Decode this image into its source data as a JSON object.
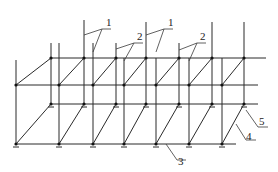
{
  "diagram": {
    "type": "scaffold-frame-isometric",
    "colors": {
      "line": "#2a2a2a",
      "node": "#111111",
      "background": "#ffffff"
    },
    "rows": {
      "back_upper_y": 58,
      "front_upper_y": 85,
      "back_lower_y": 104,
      "front_lower_y": 144
    },
    "back_x": [
      51,
      84,
      116,
      146,
      179,
      212,
      244
    ],
    "front_x": [
      16,
      59,
      93,
      124,
      156,
      189,
      222
    ],
    "labels": [
      {
        "id": "1a",
        "text": "1",
        "x": 106,
        "y": 26
      },
      {
        "id": "1b",
        "text": "1",
        "x": 168,
        "y": 26
      },
      {
        "id": "2a",
        "text": "2",
        "x": 137,
        "y": 40
      },
      {
        "id": "2b",
        "text": "2",
        "x": 200,
        "y": 40
      },
      {
        "id": "3",
        "text": "3",
        "x": 178,
        "y": 165
      },
      {
        "id": "4",
        "text": "4",
        "x": 245,
        "y": 141
      },
      {
        "id": "5",
        "text": "5",
        "x": 257,
        "y": 125
      }
    ]
  }
}
